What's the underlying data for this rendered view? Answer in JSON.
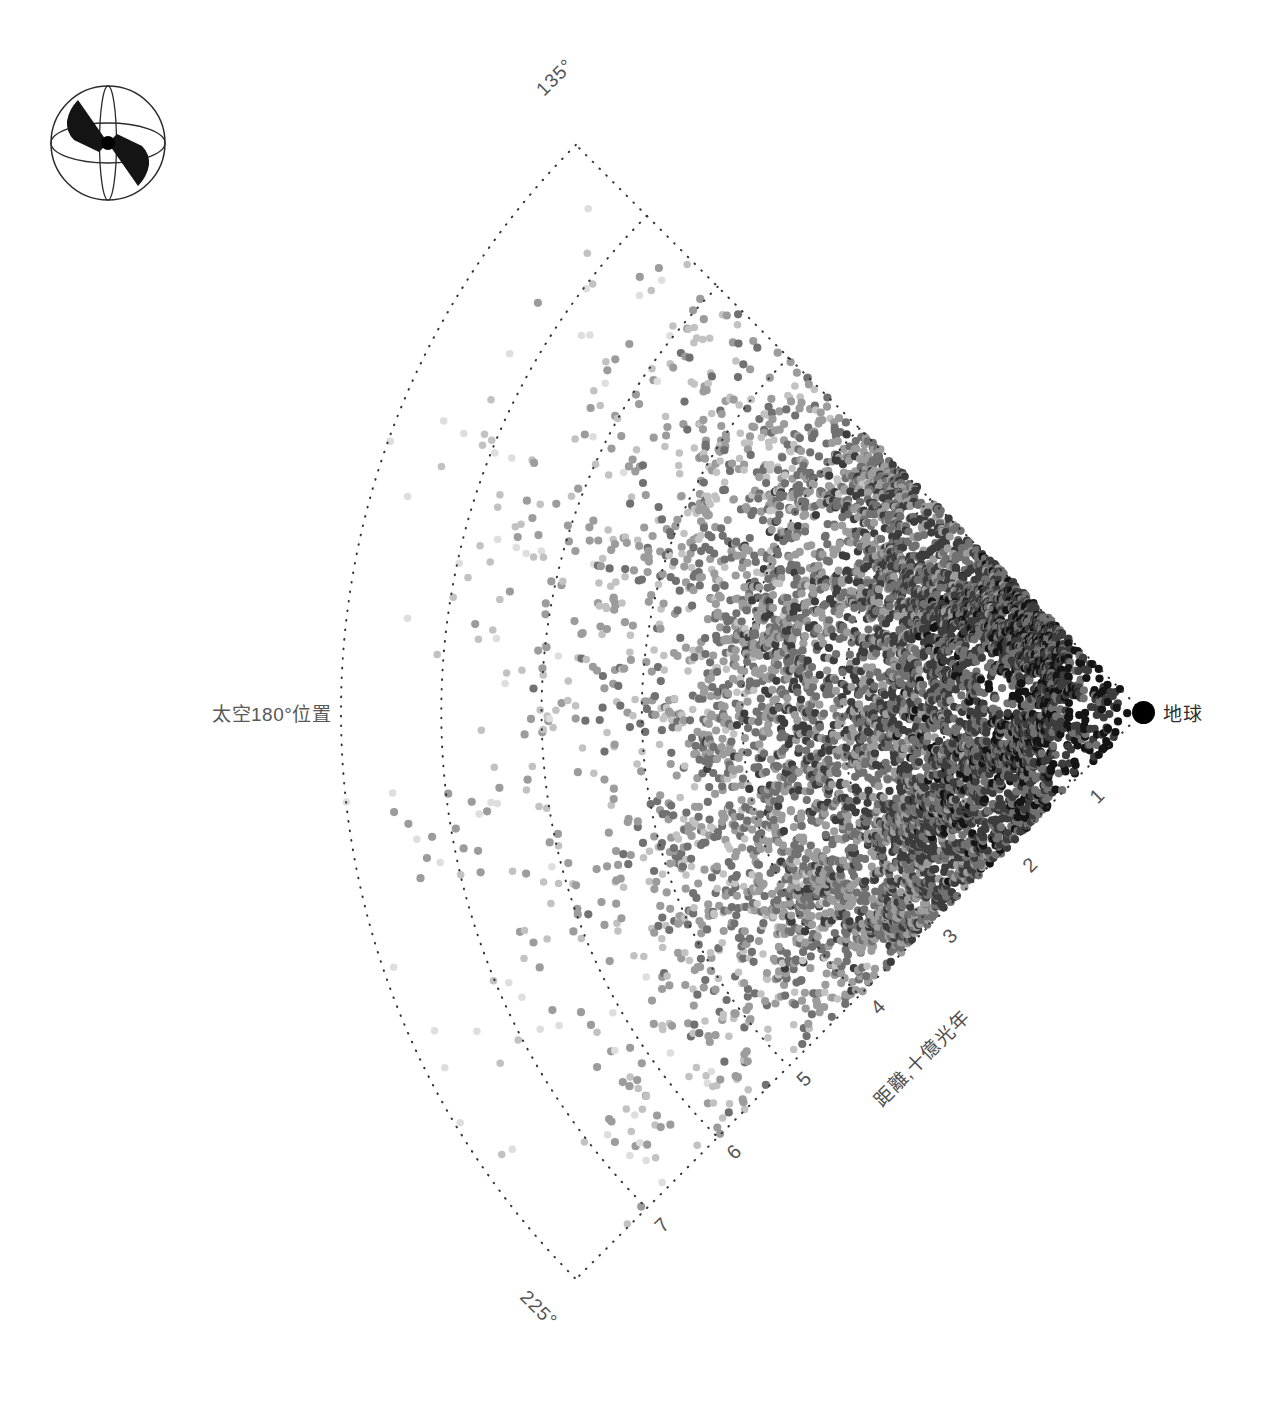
{
  "figure": {
    "kind": "galaxy-redshift-wedge",
    "background_color": "#ffffff"
  },
  "labels": {
    "space_180": "太空180°位置",
    "earth": "地球",
    "axis_title": "距離,十億光年",
    "angle_top": "135°",
    "angle_bottom": "225°"
  },
  "legend_icon": {
    "name": "survey-sphere-icon",
    "description": "sphere-with-double-wedge"
  },
  "chart_data": {
    "type": "scatter",
    "projection": "polar-wedge",
    "title": "",
    "xlabel": "距離,十億光年",
    "ylabel": "",
    "origin_label": "地球",
    "far_label": "太空180°位置",
    "angle_unit": "degrees",
    "angle_range": [
      135,
      225
    ],
    "angle_ticks": [
      "135°",
      "225°"
    ],
    "radial_unit": "十億光年",
    "radial_ticks": [
      1,
      2,
      3,
      4,
      5,
      6,
      7
    ],
    "radial_range": [
      0,
      8
    ],
    "grid": "dotted-arcs-and-radials",
    "grid_color": "#333333",
    "legend_position": "none",
    "point_count": 7200,
    "point_radius_px": 4.1,
    "point_shades": [
      "#141414",
      "#3d3d3d",
      "#717171",
      "#9c9c9c",
      "#c2c2c2",
      "#dedede"
    ],
    "density_profile": {
      "description": "surface density falls steeply with distance from Earth; brightness/darkness of points also fades with distance",
      "peak_distance": 1.4,
      "peak_half_width": 1.1,
      "falloff": "exponential-with-magnitude-limit"
    },
    "filament_structure": {
      "description": "large-scale cosmic-web filaments and voids modulate the point density",
      "n_filaments": 46,
      "n_voids": 54,
      "contrast": 0.75
    }
  },
  "geometry": {
    "apex_x": 1143,
    "apex_y": 712,
    "max_radius_px": 802,
    "half_angle_deg": 45,
    "tick_positions": [
      {
        "value": 1,
        "x": 1085,
        "y": 792,
        "rot": -45
      },
      {
        "value": 2,
        "x": 1018,
        "y": 861,
        "rot": -45
      },
      {
        "value": 3,
        "x": 938,
        "y": 932,
        "rot": -45
      },
      {
        "value": 4,
        "x": 866,
        "y": 1003,
        "rot": -45
      },
      {
        "value": 5,
        "x": 792,
        "y": 1075,
        "rot": -45
      },
      {
        "value": 6,
        "x": 722,
        "y": 1148,
        "rot": -45
      },
      {
        "value": 7,
        "x": 650,
        "y": 1221,
        "rot": -45
      }
    ],
    "angle_label_positions": [
      {
        "label": "135°",
        "x": 532,
        "y": 85,
        "rot": -45
      },
      {
        "label": "225°",
        "x": 531,
        "y": 1286,
        "rot": 45
      }
    ]
  }
}
